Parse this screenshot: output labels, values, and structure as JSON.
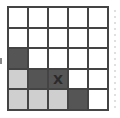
{
  "grid": {
    "rows": 5,
    "cols": 5,
    "cells": [
      [
        {
          "fill": "white",
          "label": ""
        },
        {
          "fill": "white",
          "label": ""
        },
        {
          "fill": "white",
          "label": ""
        },
        {
          "fill": "white",
          "label": ""
        },
        {
          "fill": "white",
          "label": ""
        }
      ],
      [
        {
          "fill": "white",
          "label": ""
        },
        {
          "fill": "white",
          "label": ""
        },
        {
          "fill": "white",
          "label": ""
        },
        {
          "fill": "white",
          "label": ""
        },
        {
          "fill": "white",
          "label": ""
        }
      ],
      [
        {
          "fill": "dark",
          "label": ""
        },
        {
          "fill": "white",
          "label": ""
        },
        {
          "fill": "white",
          "label": ""
        },
        {
          "fill": "white",
          "label": ""
        },
        {
          "fill": "white",
          "label": ""
        }
      ],
      [
        {
          "fill": "light",
          "label": ""
        },
        {
          "fill": "dark",
          "label": ""
        },
        {
          "fill": "dark",
          "label": "X"
        },
        {
          "fill": "white",
          "label": ""
        },
        {
          "fill": "white",
          "label": ""
        }
      ],
      [
        {
          "fill": "light",
          "label": ""
        },
        {
          "fill": "light",
          "label": ""
        },
        {
          "fill": "light",
          "label": ""
        },
        {
          "fill": "dark",
          "label": ""
        },
        {
          "fill": "white",
          "label": ""
        }
      ]
    ]
  },
  "colors": {
    "dark": "#555555",
    "light": "#cfcfcf",
    "white": "#ffffff",
    "border": "#444444"
  }
}
